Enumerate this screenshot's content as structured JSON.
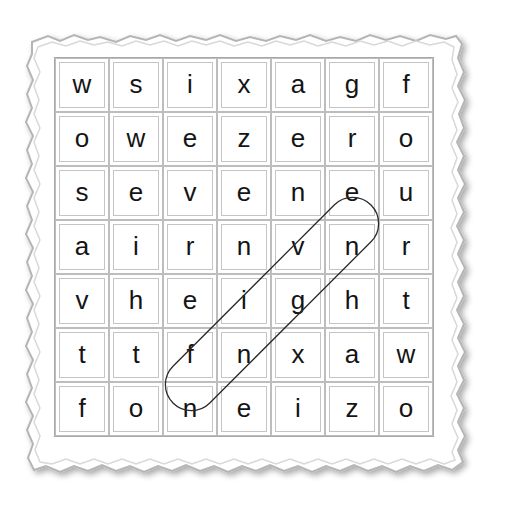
{
  "puzzle": {
    "type": "word-search",
    "rows": 7,
    "cols": 7,
    "grid": [
      [
        "w",
        "s",
        "i",
        "x",
        "a",
        "g",
        "f"
      ],
      [
        "o",
        "w",
        "e",
        "z",
        "e",
        "r",
        "o"
      ],
      [
        "s",
        "e",
        "v",
        "e",
        "n",
        "e",
        "u"
      ],
      [
        "a",
        "i",
        "r",
        "n",
        "v",
        "n",
        "r"
      ],
      [
        "v",
        "h",
        "e",
        "i",
        "g",
        "h",
        "t"
      ],
      [
        "t",
        "t",
        "f",
        "n",
        "x",
        "a",
        "w"
      ],
      [
        "f",
        "o",
        "n",
        "e",
        "i",
        "z",
        "o"
      ]
    ],
    "circled_words": [
      {
        "word": "fn ge",
        "cells": [
          [
            5,
            2
          ],
          [
            4,
            3
          ],
          [
            3,
            4
          ],
          [
            2,
            5
          ]
        ],
        "letters": [
          "f",
          "i",
          "v",
          "e"
        ],
        "direction": "diagonal-up-right"
      }
    ]
  },
  "colors": {
    "cell_border": "#bdbdbd",
    "frame_border": "#bfbfbf",
    "letter": "#141414",
    "circle_stroke": "#2a2a2a"
  }
}
